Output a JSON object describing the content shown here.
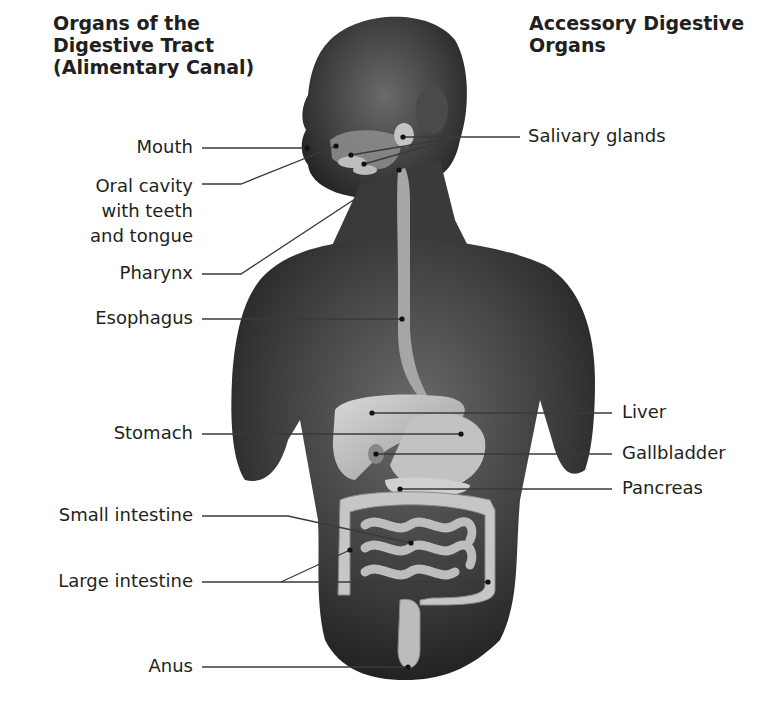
{
  "headings": {
    "left": [
      "Organs of the",
      "Digestive Tract",
      "(Alimentary Canal)"
    ],
    "right": [
      "Accessory Digestive",
      "Organs"
    ]
  },
  "left_labels": {
    "mouth": "Mouth",
    "oral_cavity": [
      "Oral cavity",
      "with teeth",
      "and tongue"
    ],
    "pharynx": "Pharynx",
    "esophagus": "Esophagus",
    "stomach": "Stomach",
    "small_intestine": "Small intestine",
    "large_intestine": "Large intestine",
    "anus": "Anus"
  },
  "right_labels": {
    "salivary_glands": "Salivary glands",
    "liver": "Liver",
    "gallbladder": "Gallbladder",
    "pancreas": "Pancreas"
  },
  "colors": {
    "text": "#231f20",
    "leader_line": "#3a3a3a",
    "skin_dark": "#2e2e2e",
    "skin_mid": "#5a5a5a",
    "organ_light": "#c9c9c9",
    "organ_mid": "#a8a8a8"
  }
}
